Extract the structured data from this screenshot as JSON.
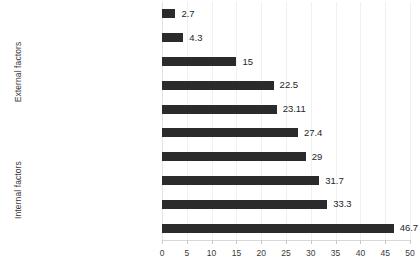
{
  "chart_data": {
    "type": "bar",
    "orientation": "horizontal",
    "title": "",
    "xlabel": "",
    "ylabel": "",
    "xlim": [
      0,
      50
    ],
    "xticks": [
      0,
      5,
      10,
      15,
      20,
      25,
      30,
      35,
      40,
      45,
      50
    ],
    "grid": true,
    "legend": false,
    "bar_color": "#2b2b2b",
    "categories": [
      "participating of other inmates",
      "motivation by employees",
      "motivation by family members",
      "possibility of conditional release",
      "compulsory participation",
      "better inmate evaluation",
      "getting a job",
      "spending leisure time",
      "inclusion in society",
      "self-improvement"
    ],
    "values": [
      2.7,
      4.3,
      15,
      22.5,
      23.11,
      27.4,
      29,
      31.7,
      33.3,
      46.7
    ],
    "value_labels": [
      "2.7",
      "4.3",
      "15",
      "22.5",
      "23.11",
      "27.4",
      "29",
      "31.7",
      "33.3",
      "46.7"
    ],
    "groups": [
      {
        "label": "External factors",
        "categories": [
          "participating of other inmates",
          "motivation by employees",
          "motivation by family members",
          "possibility of conditional release",
          "compulsory participation"
        ]
      },
      {
        "label": "Internal factors",
        "categories": [
          "better inmate evaluation",
          "getting a job",
          "spending leisure time",
          "inclusion in society",
          "self-improvement"
        ]
      }
    ]
  }
}
